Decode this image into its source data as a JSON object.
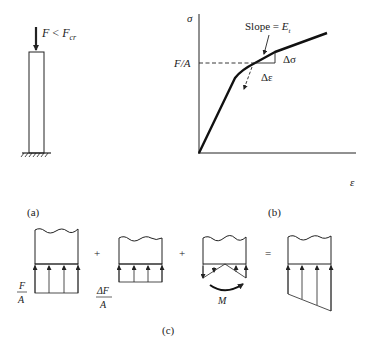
{
  "figure": {
    "panel_a": {
      "caption": "(a)",
      "load_label": {
        "main": "F",
        "relation": " < ",
        "critical": "F",
        "critical_sub": "cr"
      }
    },
    "panel_b": {
      "caption": "(b)",
      "y_axis_label": "σ",
      "x_axis_label": "ε",
      "y_marker_label": "F/A",
      "slope_label": {
        "prefix": "Slope = ",
        "symbol": "E",
        "sub": "t"
      },
      "delta_sigma": "Δσ",
      "delta_epsilon": "Δε"
    },
    "panel_c": {
      "caption": "(c)",
      "operators": [
        "+",
        "+",
        "="
      ],
      "term1_label": {
        "num": "F",
        "den": "A"
      },
      "term2_label": {
        "num": "ΔF",
        "den": "A"
      },
      "term3_label": "M"
    }
  },
  "colors": {
    "ink": "#222222",
    "background": "#ffffff"
  }
}
